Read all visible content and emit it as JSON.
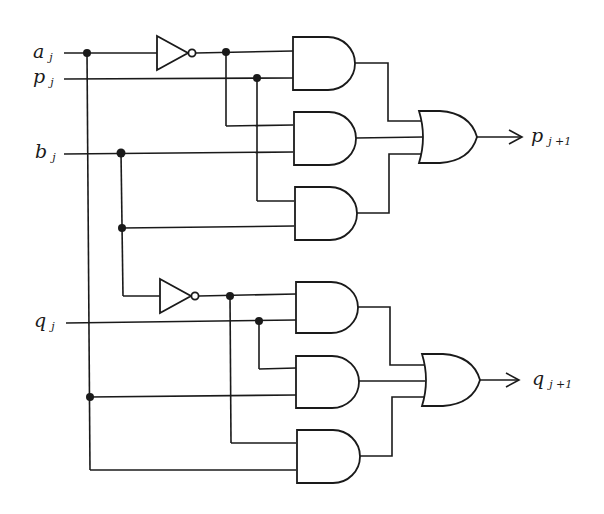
{
  "figure": {
    "type": "logic-circuit",
    "inputs": [
      {
        "id": "a",
        "name": "a",
        "subscript": "j"
      },
      {
        "id": "p",
        "name": "p",
        "subscript": "j"
      },
      {
        "id": "b",
        "name": "b",
        "subscript": "j"
      },
      {
        "id": "q",
        "name": "q",
        "subscript": "j"
      }
    ],
    "outputs": [
      {
        "id": "p_next",
        "name": "p",
        "subscript": "j +1"
      },
      {
        "id": "q_next",
        "name": "q",
        "subscript": "j +1"
      }
    ],
    "gates": [
      {
        "id": "not1",
        "type": "NOT",
        "inputs": [
          "a"
        ]
      },
      {
        "id": "not2",
        "type": "NOT",
        "inputs": [
          "b"
        ]
      },
      {
        "id": "and1",
        "type": "AND",
        "inputs": [
          "not1",
          "p"
        ]
      },
      {
        "id": "and2",
        "type": "AND",
        "inputs": [
          "not1",
          "b"
        ]
      },
      {
        "id": "and3",
        "type": "AND",
        "inputs": [
          "p",
          "b"
        ]
      },
      {
        "id": "or1",
        "type": "OR",
        "inputs": [
          "and1",
          "and2",
          "and3"
        ],
        "output": "p_next"
      },
      {
        "id": "and4",
        "type": "AND",
        "inputs": [
          "not2",
          "q"
        ]
      },
      {
        "id": "and5",
        "type": "AND",
        "inputs": [
          "q",
          "a"
        ]
      },
      {
        "id": "and6",
        "type": "AND",
        "inputs": [
          "not2",
          "a"
        ]
      },
      {
        "id": "or2",
        "type": "OR",
        "inputs": [
          "and4",
          "and5",
          "and6"
        ],
        "output": "q_next"
      }
    ]
  }
}
